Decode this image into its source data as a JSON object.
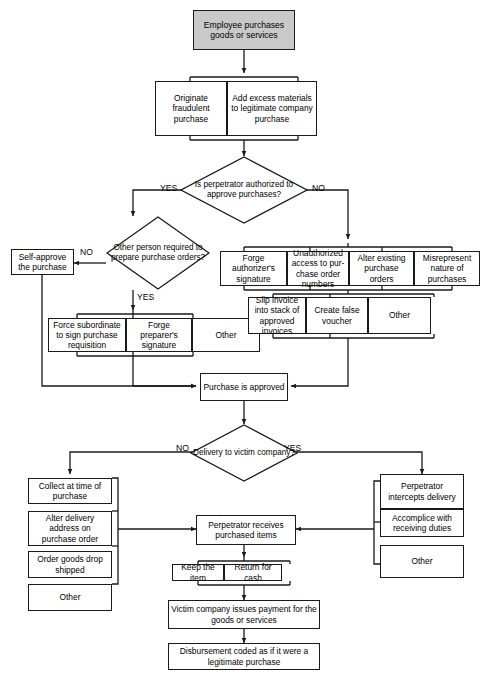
{
  "diagram": {
    "colors": {
      "start_fill": "#c9c9c9",
      "box_fill": "#ffffff",
      "stroke": "#1a1a1a",
      "text": "#000000"
    }
  },
  "nodes": {
    "start": "Employee purchases goods or services",
    "originate_fraudulent": "Originate fraudulent purchase",
    "add_excess": "Add excess materials to legitimate company purchase",
    "decision_authorized": "Is perpetrator authorized to approve purchases?",
    "decision_other_person": "Other person required to prepare purchase orders?",
    "self_approve": "Self-approve the purchase",
    "force_subordinate": "Force subordinate to sign purchase requisition",
    "forge_preparer": "Forge preparer's signature",
    "other_yes_branch": "Other",
    "forge_authorizer": "Forge authorizer's signature",
    "unauthorized_access": "Unauthorized access to pur-chase order numbers",
    "alter_existing": "Alter existing purchase orders",
    "misrepresent": "Misrepresent nature of purchases",
    "slip_invoice": "Slip invoice into stack of approved invoices",
    "create_false_voucher": "Create false voucher",
    "other_no_branch": "Other",
    "purchase_approved": "Purchase is approved",
    "decision_delivery": "Delivery to victim company?",
    "collect_at_time": "Collect at time of purchase",
    "alter_delivery_address": "Alter delivery address on purchase order",
    "order_drop_shipped": "Order goods drop shipped",
    "other_delivery_no": "Other",
    "perpetrator_intercepts": "Perpetrator intercepts delivery",
    "accomplice_receiving": "Accomplice with receiving duties",
    "other_delivery_yes": "Other",
    "perpetrator_receives": "Perpetrator receives purchased items",
    "keep_item": "Keep the item",
    "return_for_cash": "Return for cash",
    "victim_pays": "Victim company issues payment for the goods or services",
    "disbursement_coded": "Disbursement coded as if it were a legitimate purchase"
  },
  "edge_labels": {
    "authorized_yes": "YES",
    "authorized_no": "NO",
    "other_person_no": "NO",
    "other_person_yes": "YES",
    "delivery_no": "NO",
    "delivery_yes": "YES"
  }
}
